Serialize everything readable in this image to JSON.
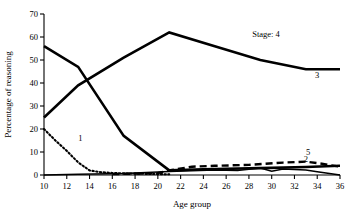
{
  "chart_data": {
    "type": "line",
    "title": "",
    "xlabel": "Age group",
    "ylabel": "Percentage of reasoning",
    "xlim": [
      10,
      36
    ],
    "ylim": [
      0,
      70
    ],
    "xticks": [
      10,
      12,
      14,
      16,
      18,
      20,
      22,
      24,
      26,
      28,
      30,
      32,
      34,
      36
    ],
    "yticks": [
      0,
      10,
      20,
      30,
      40,
      50,
      60,
      70
    ],
    "grid": false,
    "legend": "inline-labels",
    "legend_prefix": "Stage:",
    "series": [
      {
        "name": "1",
        "label": "1",
        "style": "dotted",
        "label_x": 13.2,
        "label_y": 15,
        "x": [
          10,
          11,
          12,
          13,
          14,
          15,
          16,
          17,
          18,
          19,
          20,
          21
        ],
        "y": [
          20,
          15,
          10.5,
          5.5,
          2,
          1.2,
          0.9,
          0.7,
          0.6,
          0.5,
          0.4,
          0.3
        ]
      },
      {
        "name": "2",
        "label": "2",
        "style": "solid-thin",
        "label_x": 33.0,
        "label_y": 5.5,
        "x": [
          10,
          13,
          17,
          21,
          23,
          25,
          27,
          29,
          30,
          31,
          33,
          34,
          36
        ],
        "y": [
          0,
          0.3,
          0.6,
          1.5,
          1.8,
          2.2,
          2.0,
          3.0,
          1.6,
          2.6,
          2.2,
          1.4,
          0
        ]
      },
      {
        "name": "3",
        "label": "3",
        "style": "solid-thick",
        "label_x": 34.0,
        "label_y": 42,
        "x": [
          10,
          13,
          17,
          21,
          25,
          29,
          33,
          36
        ],
        "y": [
          25,
          39,
          51,
          62,
          56,
          50,
          46,
          46
        ]
      },
      {
        "name": "4",
        "label": "Stage: 4",
        "style": "solid-thick",
        "label_x": 29.5,
        "label_y": 60,
        "x": [
          10,
          13,
          17,
          21,
          24,
          29,
          33,
          36
        ],
        "y": [
          56,
          47,
          17,
          2,
          2.5,
          3,
          3.5,
          4
        ]
      },
      {
        "name": "5",
        "label": "5",
        "style": "dashed",
        "label_x": 33.2,
        "label_y": 8.5,
        "x": [
          16,
          18,
          20,
          21,
          23,
          25,
          28,
          31,
          33,
          34,
          36
        ],
        "y": [
          0.4,
          0.6,
          0.8,
          2.0,
          3.6,
          4.0,
          4.4,
          5.4,
          5.8,
          5.2,
          3.6
        ]
      }
    ],
    "note_series_mapping": {
      "rising_thick_from_25": "3",
      "falling_thick_from_56": "4"
    }
  }
}
